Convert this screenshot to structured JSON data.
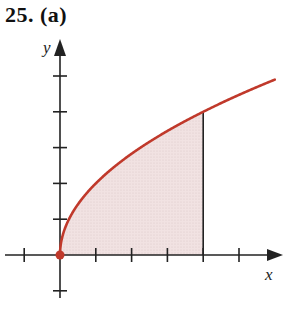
{
  "problem_label": "25. (a)",
  "chart_data": {
    "type": "area",
    "title": "25. (a)",
    "xlabel": "x",
    "ylabel": "y",
    "function": "y = 2*sqrt(x)",
    "curve_points": {
      "x": [
        0,
        0.25,
        0.5,
        1,
        1.5,
        2,
        2.5,
        3,
        3.5,
        4,
        4.5,
        5,
        5.5,
        6
      ],
      "y": [
        0,
        1.0,
        1.41,
        2.0,
        2.45,
        2.83,
        3.16,
        3.46,
        3.74,
        4.0,
        4.24,
        4.47,
        4.69,
        4.9
      ]
    },
    "shaded_region": {
      "x_from": 0,
      "x_to": 4,
      "description": "area under curve from x=0 to x=4"
    },
    "x_ticks": [
      -1,
      1,
      2,
      3,
      4,
      5
    ],
    "y_ticks": [
      -1,
      1,
      2,
      3,
      4,
      5
    ],
    "xlim": [
      -1.2,
      6.3
    ],
    "ylim": [
      -1.7,
      5.6
    ],
    "grid": false,
    "legend": null,
    "colors": {
      "curve": "#c0392b",
      "fill": "#efdede",
      "axes": "#222222",
      "origin_dot": "#c0392b"
    }
  }
}
